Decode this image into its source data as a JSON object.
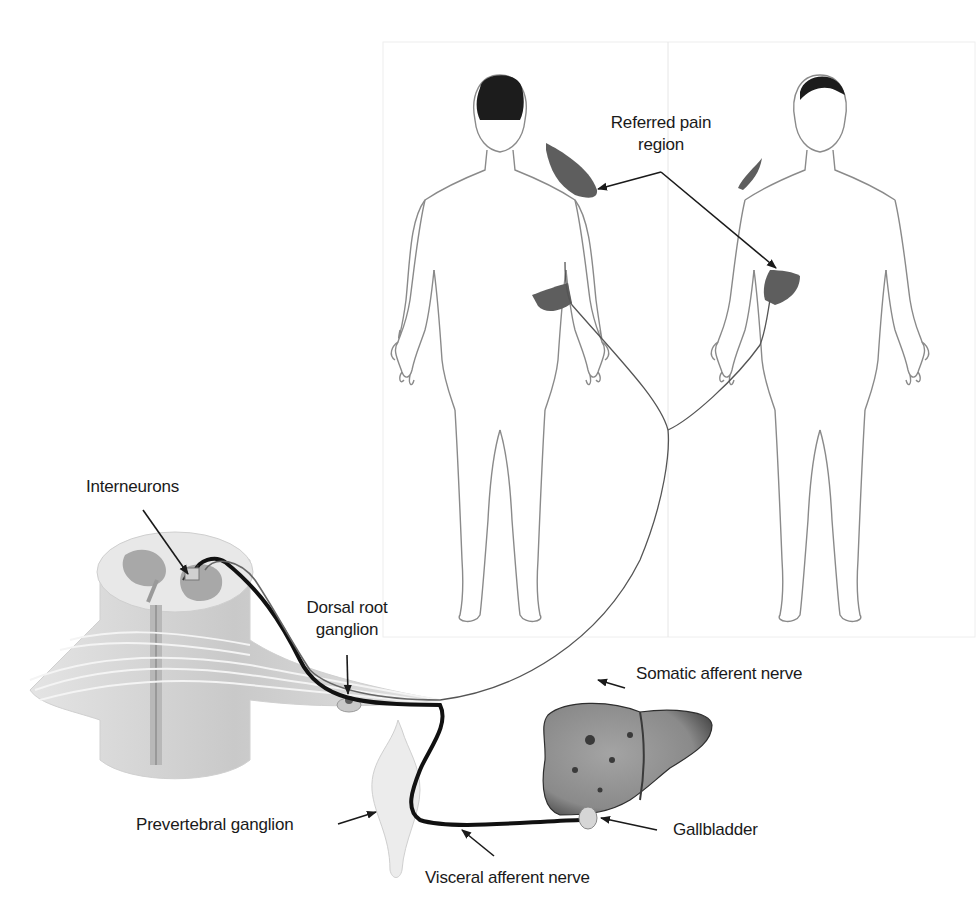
{
  "diagram": {
    "topic": "Referred pain pathway from gallbladder",
    "labels": {
      "referred_pain_region": [
        "Referred pain",
        "region"
      ],
      "interneurons": "Interneurons",
      "dorsal_root_ganglion": [
        "Dorsal root",
        "ganglion"
      ],
      "somatic_afferent_nerve": "Somatic afferent nerve",
      "prevertebral_ganglion": "Prevertebral ganglion",
      "gallbladder": "Gallbladder",
      "visceral_afferent_nerve": "Visceral afferent nerve"
    },
    "figures": [
      {
        "id": "back-view",
        "view": "posterior",
        "shaded_regions": [
          "right-shoulder-blade",
          "right-flank"
        ]
      },
      {
        "id": "front-view",
        "view": "anterior",
        "shaded_regions": [
          "right-shoulder",
          "right-upper-abdomen"
        ]
      }
    ],
    "structures": [
      "spinal-cord-cross-section",
      "dorsal-root-ganglion",
      "prevertebral-ganglion",
      "liver",
      "gallbladder"
    ],
    "colors": {
      "outline": "#8a8a8a",
      "shaded_region": "#5e5e5e",
      "hair": "#1c1c1c",
      "nerve_visceral": "#111111",
      "nerve_somatic": "#555555",
      "spinal_cord": "#d8d8d8",
      "grey_matter": "#a8a8a8",
      "liver": "#8c8c8c"
    }
  }
}
